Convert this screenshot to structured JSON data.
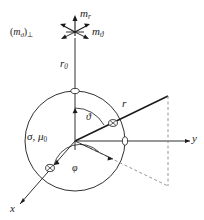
{
  "figure": {
    "background_color": "#ffffff",
    "line_color": "#1a1a1a",
    "dash_color": "#8a8a8a",
    "labels": {
      "m_r": "m",
      "m_r_sub": "r",
      "m_theta": "m",
      "m_theta_sub": "ϑ",
      "m_theta_perp_open": "(",
      "m_theta_perp_base": "m",
      "m_theta_perp_sub": "ϑ",
      "m_theta_perp_close": ")",
      "m_theta_perp_perp": "⊥",
      "r_zero": "r",
      "r_zero_sub": "0",
      "r_vector": "r",
      "theta_angle": "ϑ",
      "phi_angle": "φ",
      "sigma_mu": "σ, μ",
      "sigma_mu_sub": "0",
      "axis_y": "y",
      "axis_x": "x"
    },
    "markers": {
      "sphere_top_marker": "circle-marker",
      "sphere_y_marker": "circle-marker",
      "ray_cross_marker": "crossed-circle-marker",
      "x_axis_cross_marker": "crossed-circle-marker"
    },
    "geometry": {
      "origin_x": 75,
      "origin_y": 141,
      "sphere_radius": 50,
      "dipole_y": 32,
      "r_tip_x": 168,
      "r_tip_y": 96,
      "projection_x": 168,
      "projection_y": 186,
      "y_axis_end_x": 192,
      "x_axis_end_x": 18,
      "x_axis_end_y": 206
    }
  }
}
